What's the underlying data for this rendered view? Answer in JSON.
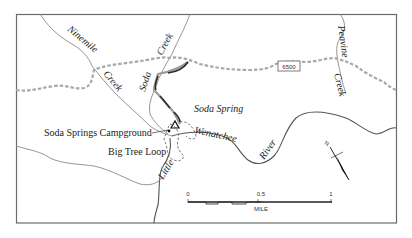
{
  "map": {
    "labels": {
      "ninemile": "Ninemile",
      "ninemile_creek": "Creek",
      "soda": "Soda",
      "soda_creek": "Creek",
      "peavine": "Peavine",
      "peavine_creek": "Creek",
      "road_number": "6500",
      "soda_spring": "Soda Spring",
      "campground": "Soda Springs Campground",
      "big_tree_loop": "Big Tree Loop",
      "little": "Little",
      "wenatchee": "Wenatchee",
      "river": "River"
    },
    "scale_bar": {
      "tick_0": "0",
      "tick_mid": "0.5",
      "tick_end": "1",
      "unit": "MILE"
    },
    "north_arrow": {
      "label": "N"
    },
    "colors": {
      "border": "#6b6b6b",
      "creek": "#8a8a8a",
      "road": "#a8a8a8",
      "trail": "#2a2a2a",
      "text": "#222222"
    }
  }
}
